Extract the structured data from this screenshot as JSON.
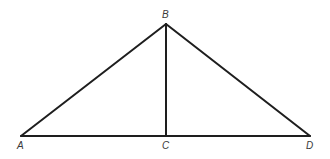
{
  "diagram": {
    "type": "geometry",
    "colors": {
      "stroke": "#1e1e1e",
      "label": "#3a3a3a",
      "background": "#ffffff"
    },
    "points": {
      "A": {
        "label": "A",
        "x": 21,
        "y": 136
      },
      "B": {
        "label": "B",
        "x": 166,
        "y": 24
      },
      "C": {
        "label": "C",
        "x": 166,
        "y": 136
      },
      "D": {
        "label": "D",
        "x": 310,
        "y": 136
      }
    },
    "segments": [
      {
        "name": "AB",
        "from": "A",
        "to": "B"
      },
      {
        "name": "BD",
        "from": "B",
        "to": "D"
      },
      {
        "name": "AD",
        "from": "A",
        "to": "D"
      },
      {
        "name": "BC",
        "from": "B",
        "to": "C"
      }
    ],
    "labels": {
      "A": "A",
      "B": "B",
      "C": "C",
      "D": "D"
    }
  }
}
